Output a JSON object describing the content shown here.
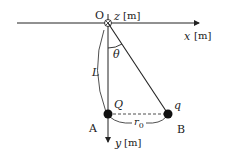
{
  "labels": {
    "origin": "O",
    "z_axis": "z",
    "z_unit": "[m]",
    "x_axis": "x",
    "x_unit": "[m]",
    "y_axis": "y",
    "y_unit": "[m]",
    "angle": "θ",
    "length": "L",
    "charge_A": "Q",
    "charge_B": "q",
    "point_A": "A",
    "point_B": "B",
    "distance": "r",
    "distance_sub": "0"
  },
  "colors": {
    "ink": "#222222",
    "background": "#ffffff"
  }
}
